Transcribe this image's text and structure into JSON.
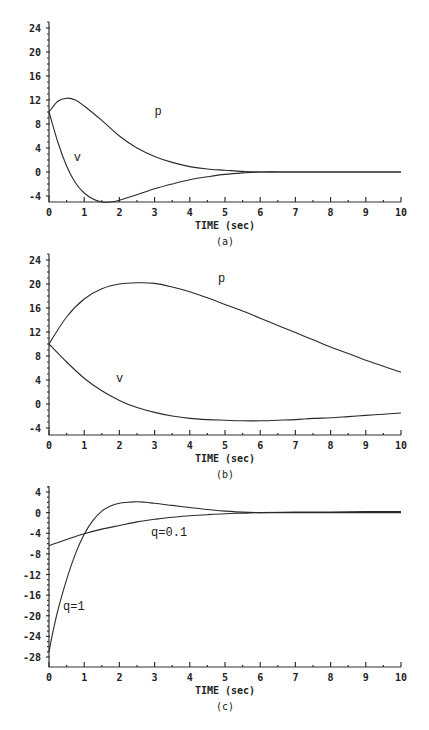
{
  "chart_data": [
    {
      "id": "a",
      "type": "line",
      "caption": "(a)",
      "title": "",
      "xlabel": "TIME (sec)",
      "ylabel": "",
      "xlim": [
        0,
        10
      ],
      "ylim": [
        -5,
        25
      ],
      "xticks": [
        0,
        1,
        2,
        3,
        4,
        5,
        6,
        7,
        8,
        9,
        10
      ],
      "xtick_labels": [
        "0",
        "1",
        "2",
        "3",
        "4",
        "5",
        "6",
        "7",
        "8",
        "9",
        "10"
      ],
      "yticks": [
        -4,
        0,
        4,
        8,
        12,
        16,
        20,
        24
      ],
      "ytick_labels": [
        "-4",
        "0",
        "4",
        "8",
        "12",
        "16",
        "20",
        "24"
      ],
      "grid": false,
      "layout": {
        "x0": 49,
        "x1": 401,
        "y_top_val": 24,
        "y_top_px": 28,
        "y_bot_val": -4,
        "y_bot_px": 196,
        "axis_y_px": 202,
        "axis_top_px": 22
      },
      "series": [
        {
          "name": "p",
          "label_pos": [
            3.0,
            9.5
          ],
          "x": [
            0,
            0.25,
            0.5,
            0.75,
            1.0,
            1.5,
            2.0,
            2.5,
            3.0,
            3.5,
            4.0,
            4.5,
            5.0,
            5.5,
            6.0,
            7.0,
            8.0,
            9.0,
            10.0
          ],
          "y": [
            10,
            11.8,
            12.3,
            12.0,
            11.0,
            8.6,
            6.0,
            4.0,
            2.6,
            1.6,
            0.9,
            0.5,
            0.3,
            0.1,
            0.0,
            0.0,
            0.0,
            0.0,
            0.0
          ]
        },
        {
          "name": "v",
          "label_pos": [
            0.7,
            1.8
          ],
          "x": [
            0,
            0.25,
            0.5,
            0.75,
            1.0,
            1.25,
            1.5,
            1.75,
            2.0,
            2.5,
            3.0,
            3.5,
            4.0,
            4.5,
            5.0,
            5.5,
            6.0,
            7.0,
            8.0,
            9.0,
            10.0
          ],
          "y": [
            10,
            5.0,
            1.0,
            -1.8,
            -3.5,
            -4.5,
            -5.0,
            -5.0,
            -4.7,
            -3.8,
            -2.8,
            -2.0,
            -1.3,
            -0.8,
            -0.4,
            -0.15,
            0.0,
            0.0,
            0.0,
            0.0,
            0.0
          ]
        }
      ]
    },
    {
      "id": "b",
      "type": "line",
      "caption": "(b)",
      "title": "",
      "xlabel": "TIME (sec)",
      "ylabel": "",
      "xlim": [
        0,
        10
      ],
      "ylim": [
        -5,
        25
      ],
      "xticks": [
        0,
        1,
        2,
        3,
        4,
        5,
        6,
        7,
        8,
        9,
        10
      ],
      "xtick_labels": [
        "0",
        "1",
        "2",
        "3",
        "4",
        "5",
        "6",
        "7",
        "8",
        "9",
        "10"
      ],
      "yticks": [
        -4,
        0,
        4,
        8,
        12,
        16,
        20,
        24
      ],
      "ytick_labels": [
        "-4",
        "0",
        "4",
        "8",
        "12",
        "16",
        "20",
        "24"
      ],
      "grid": false,
      "layout": {
        "x0": 49,
        "x1": 401,
        "y_top_val": 24,
        "y_top_px": 260,
        "y_bot_val": -4,
        "y_bot_px": 428,
        "axis_y_px": 435,
        "axis_top_px": 254
      },
      "series": [
        {
          "name": "p",
          "label_pos": [
            4.8,
            20.3
          ],
          "x": [
            0,
            0.5,
            1.0,
            1.5,
            2.0,
            2.5,
            3.0,
            3.5,
            4.0,
            4.5,
            5.0,
            5.5,
            6.0,
            6.5,
            7.0,
            7.5,
            8.0,
            8.5,
            9.0,
            9.5,
            10.0
          ],
          "y": [
            10,
            14.5,
            17.5,
            19.2,
            20.0,
            20.2,
            20.1,
            19.5,
            18.7,
            17.7,
            16.6,
            15.5,
            14.3,
            13.1,
            11.9,
            10.7,
            9.5,
            8.4,
            7.3,
            6.3,
            5.3
          ]
        },
        {
          "name": "v",
          "label_pos": [
            1.9,
            3.6
          ],
          "x": [
            0,
            0.5,
            1.0,
            1.5,
            2.0,
            2.5,
            3.0,
            3.5,
            4.0,
            4.5,
            5.0,
            5.5,
            6.0,
            6.5,
            7.0,
            7.5,
            8.0,
            8.5,
            9.0,
            9.5,
            10.0
          ],
          "y": [
            10,
            7.0,
            4.3,
            2.2,
            0.6,
            -0.6,
            -1.4,
            -2.0,
            -2.4,
            -2.6,
            -2.7,
            -2.8,
            -2.8,
            -2.7,
            -2.6,
            -2.4,
            -2.3,
            -2.1,
            -1.9,
            -1.7,
            -1.5
          ]
        }
      ]
    },
    {
      "id": "c",
      "type": "line",
      "caption": "(c)",
      "title": "",
      "xlabel": "TIME (sec)",
      "ylabel": "",
      "xlim": [
        0,
        10
      ],
      "ylim": [
        -29,
        5
      ],
      "xticks": [
        0,
        1,
        2,
        3,
        4,
        5,
        6,
        7,
        8,
        9,
        10
      ],
      "xtick_labels": [
        "0",
        "1",
        "2",
        "3",
        "4",
        "5",
        "6",
        "7",
        "8",
        "9",
        "10"
      ],
      "yticks": [
        -28,
        -24,
        -20,
        -16,
        -12,
        -8,
        -4,
        0,
        4
      ],
      "ytick_labels": [
        "-28",
        "-24",
        "-20",
        "-16",
        "-12",
        "-8",
        "-4",
        "0",
        "4"
      ],
      "grid": false,
      "layout": {
        "x0": 49,
        "x1": 401,
        "y_top_val": 4,
        "y_top_px": 492,
        "y_bot_val": -28,
        "y_bot_px": 657,
        "axis_y_px": 667,
        "axis_top_px": 486
      },
      "series": [
        {
          "name": "q=1",
          "label_pos": [
            0.4,
            -18.8
          ],
          "x": [
            0,
            0.1,
            0.25,
            0.5,
            0.75,
            1.0,
            1.25,
            1.5,
            1.75,
            2.0,
            2.25,
            2.5,
            2.75,
            3.0,
            3.5,
            4.0,
            4.5,
            5.0,
            5.5,
            6.0,
            7.0,
            8.0,
            9.0,
            10.0
          ],
          "y": [
            -27,
            -23.5,
            -19.0,
            -13.0,
            -8.0,
            -4.2,
            -1.5,
            0.3,
            1.3,
            1.8,
            2.0,
            2.1,
            2.0,
            1.8,
            1.4,
            1.0,
            0.6,
            0.3,
            0.1,
            0.0,
            0.0,
            0.0,
            0.0,
            0.0
          ]
        },
        {
          "name": "q=0.1",
          "label_pos": [
            2.9,
            -4.6
          ],
          "x": [
            0,
            0.5,
            1.0,
            1.5,
            2.0,
            2.5,
            3.0,
            3.5,
            4.0,
            4.5,
            5.0,
            5.5,
            6.0,
            7.0,
            8.0,
            9.0,
            10.0
          ],
          "y": [
            -6.4,
            -5.2,
            -4.1,
            -3.2,
            -2.5,
            -1.8,
            -1.3,
            -0.9,
            -0.6,
            -0.4,
            -0.2,
            -0.1,
            0.0,
            0.1,
            0.1,
            0.2,
            0.2
          ]
        }
      ]
    }
  ]
}
